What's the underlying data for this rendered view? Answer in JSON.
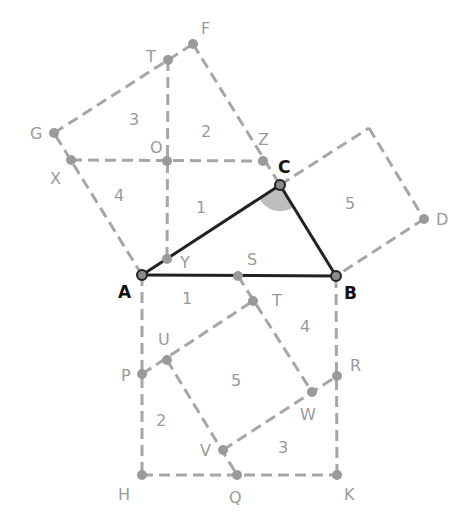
{
  "diagram": {
    "title": "",
    "colors": {
      "dashed_lines": "#a6a6a6",
      "triangle": "#222222",
      "points": "#9a9a9a",
      "angle_marker": "#bdbdbd",
      "background": "#ffffff"
    },
    "triangle": {
      "vertices": [
        "A",
        "B",
        "C"
      ],
      "right_angle_at": "C"
    },
    "points": {
      "A": {
        "label": "A",
        "x": 142,
        "y": 275,
        "lx": 118,
        "ly": 298
      },
      "B": {
        "label": "B",
        "x": 336,
        "y": 276,
        "lx": 344,
        "ly": 299
      },
      "C": {
        "label": "C",
        "x": 280,
        "y": 185,
        "lx": 280,
        "ly": 172
      },
      "D": {
        "label": "D",
        "x": 424,
        "y": 219,
        "lx": 436,
        "ly": 225
      },
      "F": {
        "label": "F",
        "x": 193,
        "y": 44,
        "lx": 201,
        "ly": 34
      },
      "G": {
        "label": "G",
        "x": 54,
        "y": 133,
        "lx": 30,
        "ly": 139
      },
      "T1": {
        "label": "T",
        "x": 168,
        "y": 60,
        "lx": 145,
        "ly": 62
      },
      "O": {
        "label": "O",
        "x": 167,
        "y": 161,
        "lx": 150,
        "ly": 153
      },
      "X": {
        "label": "X",
        "x": 71,
        "y": 160,
        "lx": 50,
        "ly": 184
      },
      "Z": {
        "label": "Z",
        "x": 263,
        "y": 161,
        "lx": 258,
        "ly": 144
      },
      "Y": {
        "label": "Y",
        "x": 167,
        "y": 259,
        "lx": 180,
        "ly": 268
      },
      "S": {
        "label": "S",
        "x": 238,
        "y": 276,
        "lx": 247,
        "ly": 265
      },
      "T2": {
        "label": "T",
        "x": 253,
        "y": 301,
        "lx": 272,
        "ly": 306
      },
      "U": {
        "label": "U",
        "x": 167,
        "y": 360,
        "lx": 158,
        "ly": 345
      },
      "P": {
        "label": "P",
        "x": 142,
        "y": 374,
        "lx": 121,
        "ly": 381
      },
      "R": {
        "label": "R",
        "x": 337,
        "y": 376,
        "lx": 350,
        "ly": 370
      },
      "W": {
        "label": "W",
        "x": 312,
        "y": 392,
        "lx": 300,
        "ly": 420
      },
      "V": {
        "label": "V",
        "x": 223,
        "y": 450,
        "lx": 200,
        "ly": 456
      },
      "H": {
        "label": "H",
        "x": 142,
        "y": 475,
        "lx": 118,
        "ly": 500
      },
      "Q": {
        "label": "Q",
        "x": 237,
        "y": 475,
        "lx": 229,
        "ly": 503
      },
      "K": {
        "label": "K",
        "x": 337,
        "y": 475,
        "lx": 344,
        "ly": 500
      }
    },
    "square_corner_unlabeled": {
      "x": 369,
      "y": 128
    },
    "region_labels": [
      {
        "text": "3",
        "x": 133,
        "y": 125
      },
      {
        "text": "2",
        "x": 205,
        "y": 137
      },
      {
        "text": "4",
        "x": 118,
        "y": 201
      },
      {
        "text": "1",
        "x": 198,
        "y": 213
      },
      {
        "text": "5",
        "x": 349,
        "y": 209
      },
      {
        "text": "1",
        "x": 184,
        "y": 304
      },
      {
        "text": "4",
        "x": 303,
        "y": 332
      },
      {
        "text": "5",
        "x": 234,
        "y": 386
      },
      {
        "text": "2",
        "x": 159,
        "y": 426
      },
      {
        "text": "3",
        "x": 281,
        "y": 453
      }
    ]
  }
}
